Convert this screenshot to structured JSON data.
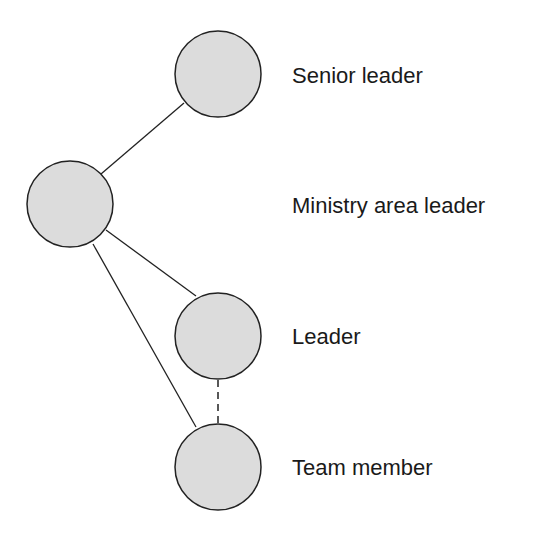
{
  "diagram": {
    "nodes": [
      {
        "id": "senior",
        "label": "Senior leader"
      },
      {
        "id": "ministry",
        "label": "Ministry area leader"
      },
      {
        "id": "leader",
        "label": "Leader"
      },
      {
        "id": "team",
        "label": "Team member"
      }
    ],
    "edges": [
      {
        "from": "senior",
        "to": "ministry",
        "style": "solid"
      },
      {
        "from": "ministry",
        "to": "leader",
        "style": "solid"
      },
      {
        "from": "ministry",
        "to": "team",
        "style": "solid"
      },
      {
        "from": "leader",
        "to": "team",
        "style": "dashed"
      }
    ],
    "colors": {
      "node_fill": "#dcdcdc",
      "stroke": "#222222"
    }
  }
}
